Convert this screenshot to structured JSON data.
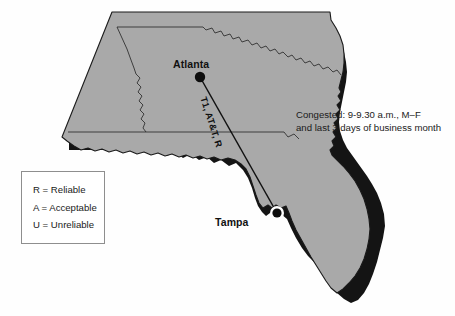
{
  "figure": {
    "type": "network-route-map",
    "region": "Georgia and Florida, United States",
    "background_color": "#fefefe",
    "map_fill_color": "#a9a9a9",
    "map_outline_color": "#1a1a1a",
    "shadow_color": "#111111"
  },
  "cities": [
    {
      "name": "Atlanta",
      "label": "Atlanta",
      "node_style": "filled-dot",
      "halo": false,
      "x": 200,
      "y": 77
    },
    {
      "name": "Tampa",
      "label": "Tampa",
      "node_style": "filled-dot-with-halo",
      "halo": true,
      "x": 277,
      "y": 213
    }
  ],
  "route": {
    "from": "Atlanta",
    "to": "Tampa",
    "label": "T1, AT&T, R",
    "circuit_type": "T1",
    "carrier": "AT&T",
    "reliability_code": "R",
    "line_color": "#111111"
  },
  "annotation": {
    "line1": "Congested: 9-9.30 a.m., M–F",
    "line2": "and last 3 days of business month"
  },
  "legend": {
    "items": [
      {
        "code": "R",
        "text": "R = Reliable"
      },
      {
        "code": "A",
        "text": "A = Acceptable"
      },
      {
        "code": "U",
        "text": "U = Unreliable"
      }
    ]
  }
}
